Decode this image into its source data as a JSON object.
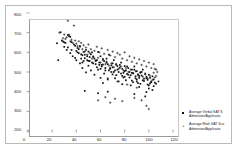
{
  "chart_data": {
    "type": "scatter",
    "title": "",
    "xlabel": "",
    "ylabel": "",
    "xlim": [
      0,
      120
    ],
    "ylim": [
      200,
      800
    ],
    "xticks": [
      0,
      20,
      40,
      60,
      80,
      100,
      120
    ],
    "yticks": [
      200,
      300,
      400,
      500,
      600,
      700,
      800
    ],
    "grid": false,
    "legend_position": "right",
    "series": [
      {
        "name": "Average Verbal SAT S",
        "name_line2": "Admission/Applicatio",
        "marker": "square",
        "color": "#111111",
        "points": [
          [
            24,
            646
          ],
          [
            25,
            560
          ],
          [
            27,
            702
          ],
          [
            28,
            660
          ],
          [
            29,
            655
          ],
          [
            30,
            651
          ],
          [
            31,
            648
          ],
          [
            33,
            688
          ],
          [
            34,
            682
          ],
          [
            35,
            679
          ],
          [
            33,
            625
          ],
          [
            36,
            612
          ],
          [
            38,
            640
          ],
          [
            39,
            633
          ],
          [
            40,
            607
          ],
          [
            41,
            600
          ],
          [
            42,
            596
          ],
          [
            43,
            632
          ],
          [
            44,
            590
          ],
          [
            45,
            585
          ],
          [
            46,
            602
          ],
          [
            47,
            570
          ],
          [
            48,
            612
          ],
          [
            49,
            560
          ],
          [
            50,
            604
          ],
          [
            51,
            556
          ],
          [
            52,
            590
          ],
          [
            53,
            548
          ],
          [
            54,
            576
          ],
          [
            55,
            568
          ],
          [
            56,
            540
          ],
          [
            57,
            560
          ],
          [
            58,
            602
          ],
          [
            59,
            536
          ],
          [
            60,
            580
          ],
          [
            61,
            528
          ],
          [
            62,
            566
          ],
          [
            63,
            556
          ],
          [
            64,
            520
          ],
          [
            65,
            548
          ],
          [
            66,
            540
          ],
          [
            67,
            588
          ],
          [
            68,
            516
          ],
          [
            69,
            534
          ],
          [
            70,
            524
          ],
          [
            71,
            560
          ],
          [
            72,
            508
          ],
          [
            73,
            540
          ],
          [
            74,
            530
          ],
          [
            75,
            500
          ],
          [
            76,
            522
          ],
          [
            77,
            548
          ],
          [
            78,
            516
          ],
          [
            79,
            496
          ],
          [
            80,
            530
          ],
          [
            81,
            508
          ],
          [
            82,
            490
          ],
          [
            83,
            520
          ],
          [
            84,
            500
          ],
          [
            85,
            484
          ],
          [
            86,
            512
          ],
          [
            87,
            494
          ],
          [
            88,
            528
          ],
          [
            89,
            478
          ],
          [
            90,
            504
          ],
          [
            91,
            488
          ],
          [
            92,
            470
          ],
          [
            93,
            498
          ],
          [
            94,
            482
          ],
          [
            95,
            512
          ],
          [
            96,
            466
          ],
          [
            97,
            492
          ],
          [
            98,
            476
          ],
          [
            99,
            460
          ],
          [
            100,
            486
          ],
          [
            101,
            470
          ],
          [
            102,
            452
          ],
          [
            103,
            478
          ],
          [
            104,
            462
          ],
          [
            105,
            446
          ],
          [
            45,
            520
          ],
          [
            48,
            498
          ],
          [
            52,
            508
          ],
          [
            55,
            486
          ],
          [
            58,
            512
          ],
          [
            60,
            470
          ],
          [
            63,
            492
          ],
          [
            66,
            462
          ],
          [
            69,
            500
          ],
          [
            72,
            468
          ],
          [
            75,
            452
          ],
          [
            78,
            480
          ],
          [
            81,
            458
          ],
          [
            84,
            472
          ],
          [
            87,
            448
          ],
          [
            90,
            462
          ],
          [
            93,
            440
          ],
          [
            96,
            454
          ],
          [
            99,
            436
          ],
          [
            102,
            448
          ],
          [
            40,
            560
          ],
          [
            43,
            544
          ],
          [
            46,
            556
          ],
          [
            50,
            532
          ],
          [
            54,
            544
          ],
          [
            57,
            524
          ],
          [
            61,
            536
          ],
          [
            64,
            508
          ],
          [
            68,
            520
          ],
          [
            71,
            500
          ],
          [
            74,
            512
          ],
          [
            77,
            492
          ],
          [
            80,
            504
          ],
          [
            83,
            486
          ],
          [
            86,
            496
          ],
          [
            89,
            468
          ],
          [
            92,
            480
          ],
          [
            95,
            458
          ],
          [
            98,
            468
          ],
          [
            101,
            442
          ],
          [
            35,
            596
          ],
          [
            37,
            580
          ],
          [
            39,
            572
          ],
          [
            42,
            616
          ],
          [
            44,
            568
          ],
          [
            47,
            588
          ],
          [
            51,
            576
          ],
          [
            56,
            558
          ],
          [
            59,
            548
          ],
          [
            62,
            538
          ],
          [
            65,
            568
          ],
          [
            70,
            544
          ],
          [
            76,
            536
          ],
          [
            82,
            528
          ],
          [
            88,
            512
          ],
          [
            94,
            500
          ],
          [
            100,
            416
          ],
          [
            104,
            428
          ],
          [
            106,
            440
          ],
          [
            98,
            398
          ],
          [
            85,
            432
          ],
          [
            92,
            424
          ],
          [
            78,
            438
          ],
          [
            66,
            400
          ],
          [
            58,
            392
          ],
          [
            47,
            404
          ],
          [
            62,
            444
          ],
          [
            88,
            388
          ],
          [
            97,
            376
          ],
          [
            103,
            408
          ],
          [
            30,
            628
          ],
          [
            32,
            612
          ],
          [
            36,
            652
          ],
          [
            41,
            622
          ],
          [
            49,
            580
          ],
          [
            53,
            600
          ],
          [
            67,
            508
          ],
          [
            73,
            484
          ],
          [
            79,
            472
          ],
          [
            86,
            456
          ],
          [
            91,
            444
          ],
          [
            45,
            548
          ],
          [
            50,
            556
          ],
          [
            60,
            516
          ],
          [
            70,
            488
          ],
          [
            80,
            476
          ],
          [
            90,
            452
          ],
          [
            100,
            432
          ]
        ]
      },
      {
        "name": "Average Math SAT Sco",
        "name_line2": "Admission/Applicatio",
        "marker": "plus",
        "color": "#111111",
        "points": [
          [
            33,
            760
          ],
          [
            38,
            736
          ],
          [
            26,
            700
          ],
          [
            34,
            690
          ],
          [
            29,
            672
          ],
          [
            31,
            668
          ],
          [
            36,
            664
          ],
          [
            42,
            656
          ],
          [
            40,
            644
          ],
          [
            44,
            648
          ],
          [
            46,
            636
          ],
          [
            48,
            624
          ],
          [
            50,
            640
          ],
          [
            52,
            616
          ],
          [
            55,
            608
          ],
          [
            57,
            628
          ],
          [
            59,
            600
          ],
          [
            61,
            620
          ],
          [
            63,
            592
          ],
          [
            66,
            612
          ],
          [
            68,
            584
          ],
          [
            70,
            604
          ],
          [
            72,
            576
          ],
          [
            74,
            596
          ],
          [
            76,
            588
          ],
          [
            78,
            568
          ],
          [
            80,
            600
          ],
          [
            82,
            560
          ],
          [
            84,
            580
          ],
          [
            86,
            552
          ],
          [
            88,
            572
          ],
          [
            90,
            544
          ],
          [
            92,
            564
          ],
          [
            94,
            536
          ],
          [
            96,
            556
          ],
          [
            98,
            528
          ],
          [
            100,
            548
          ],
          [
            102,
            520
          ],
          [
            104,
            540
          ],
          [
            106,
            512
          ],
          [
            35,
            656
          ],
          [
            43,
            628
          ],
          [
            47,
            604
          ],
          [
            51,
            596
          ],
          [
            54,
            580
          ],
          [
            58,
            572
          ],
          [
            62,
            560
          ],
          [
            65,
            552
          ],
          [
            69,
            544
          ],
          [
            73,
            536
          ],
          [
            77,
            528
          ],
          [
            81,
            520
          ],
          [
            85,
            512
          ],
          [
            89,
            504
          ],
          [
            93,
            496
          ],
          [
            97,
            488
          ],
          [
            101,
            480
          ],
          [
            105,
            472
          ],
          [
            45,
            616
          ],
          [
            49,
            588
          ],
          [
            53,
            568
          ],
          [
            56,
            556
          ],
          [
            60,
            548
          ],
          [
            64,
            540
          ],
          [
            67,
            532
          ],
          [
            71,
            524
          ],
          [
            75,
            516
          ],
          [
            79,
            508
          ],
          [
            83,
            500
          ],
          [
            87,
            492
          ],
          [
            91,
            484
          ],
          [
            95,
            476
          ],
          [
            99,
            468
          ],
          [
            103,
            460
          ],
          [
            37,
            648
          ],
          [
            41,
            632
          ],
          [
            58,
            356
          ],
          [
            68,
            344
          ],
          [
            72,
            364
          ],
          [
            98,
            328
          ],
          [
            100,
            312
          ],
          [
            94,
            356
          ],
          [
            64,
            372
          ],
          [
            78,
            352
          ],
          [
            88,
            368
          ],
          [
            30,
            690
          ],
          [
            32,
            676
          ],
          [
            39,
            660
          ],
          [
            106,
            480
          ],
          [
            104,
            496
          ],
          [
            90,
            420
          ],
          [
            82,
            436
          ],
          [
            74,
            452
          ],
          [
            66,
            468
          ],
          [
            108,
            452
          ],
          [
            107,
            500
          ],
          [
            105,
            516
          ]
        ]
      }
    ]
  },
  "axes": {
    "y_tick_labels": [
      "800",
      "700",
      "600",
      "500",
      "400",
      "300",
      "200"
    ],
    "x_tick_labels": [
      "0",
      "20",
      "40",
      "60",
      "80",
      "100",
      "120"
    ]
  },
  "legend": {
    "items": [
      {
        "marker_name": "square-marker",
        "line1": "Average Verbal SAT S",
        "line2": "Admission/Applicatio"
      },
      {
        "marker_name": "plus-marker",
        "line1": "Average Math SAT Sco",
        "line2": "Admission/Applicatio"
      }
    ]
  }
}
